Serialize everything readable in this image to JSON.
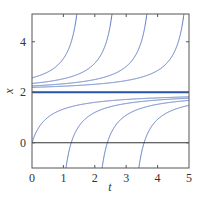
{
  "chart_data": {
    "type": "line",
    "title": "",
    "xlabel": "t",
    "ylabel": "x",
    "xlim": [
      0,
      5
    ],
    "ylim": [
      -1,
      5.1
    ],
    "xticks": [
      0,
      1,
      2,
      3,
      4,
      5
    ],
    "xtick_labels": [
      "0",
      "1",
      "2",
      "3",
      "4",
      "5"
    ],
    "yticks": [
      0,
      2,
      4
    ],
    "ytick_labels": [
      "0",
      "2",
      "4"
    ],
    "grid": false,
    "legend": null,
    "reference_lines": [
      {
        "name": "x = 0 axis",
        "y": 0,
        "color": "#333333"
      },
      {
        "name": "equilibrium x = 2",
        "y": 2,
        "color": "#2a52a8"
      }
    ],
    "series": [
      {
        "name": "upper curve 1",
        "form": "x = 2 + 1/(c - t)",
        "c": 1.75,
        "x0": 2.57,
        "exits_top_at_t": 1.43
      },
      {
        "name": "upper curve 2",
        "form": "x = 2 + 1/(c - t)",
        "c": 2.87,
        "x0": 2.35,
        "exits_top_at_t": 2.55
      },
      {
        "name": "upper curve 3",
        "form": "x = 2 + 1/(c - t)",
        "c": 3.98,
        "x0": 2.25,
        "exits_top_at_t": 3.66
      },
      {
        "name": "upper curve 4",
        "form": "x = 2 + 1/(c - t)",
        "c": 5.16,
        "x0": 2.19,
        "exits_top_at_t": 4.84
      },
      {
        "name": "lower curve 1",
        "form": "x = 2 - 1/(t - d)",
        "d": -0.5,
        "x0": 0.0
      },
      {
        "name": "lower curve 2",
        "form": "x = 2 - 1/(t - d)",
        "d": 0.75,
        "enters_bottom_at_t": 1.08
      },
      {
        "name": "lower curve 3",
        "form": "x = 2 - 1/(t - d)",
        "d": 1.9,
        "enters_bottom_at_t": 2.23
      },
      {
        "name": "lower curve 4",
        "form": "x = 2 - 1/(t - d)",
        "d": 3.07,
        "enters_bottom_at_t": 3.4
      }
    ],
    "colors": {
      "curve": "#5a78c0",
      "equilibrium": "#2a52a8",
      "frame": "#555555"
    }
  }
}
